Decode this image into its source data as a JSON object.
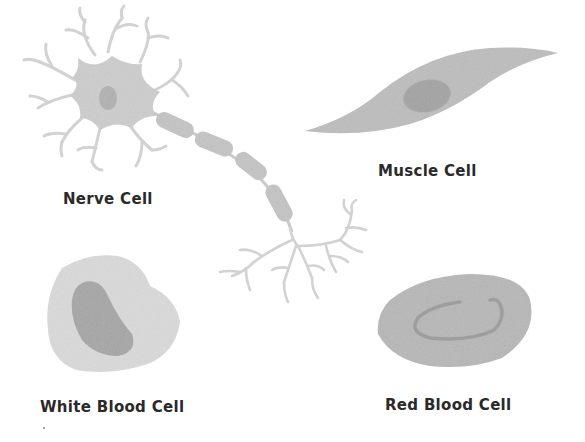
{
  "diagram": {
    "colors": {
      "background": "#ffffff",
      "cell_light": "#d4d4d4",
      "cell_medium": "#b8b8b8",
      "nucleus": "#9a9a9a",
      "dendrite": "#cfcfcf",
      "label": "#2a2a2a"
    },
    "cells": [
      {
        "id": "nerve",
        "label": "Nerve Cell",
        "parts": [
          "cell body",
          "nucleus",
          "dendrites",
          "axon with myelin segments",
          "axon terminals"
        ]
      },
      {
        "id": "muscle",
        "label": "Muscle Cell",
        "parts": [
          "spindle-shaped body",
          "nucleus"
        ]
      },
      {
        "id": "wbc",
        "label": "White Blood Cell",
        "parts": [
          "cell body",
          "nucleus"
        ]
      },
      {
        "id": "rbc",
        "label": "Red Blood Cell",
        "parts": [
          "oval disc body",
          "central depression"
        ]
      }
    ]
  }
}
